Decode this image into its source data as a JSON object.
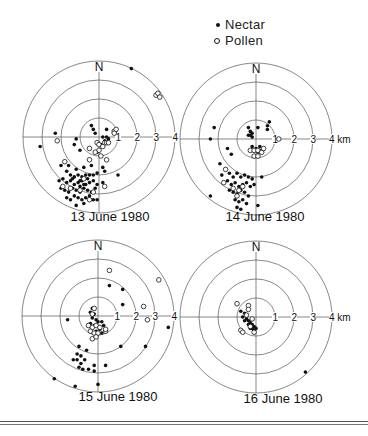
{
  "legend": {
    "nectar_label": "Nectar",
    "pollen_label": "Pollen",
    "nectar_marker": "filled-dot",
    "pollen_marker": "open-circle"
  },
  "colors": {
    "ink": "#111111",
    "grid": "#555555",
    "background": "#ffffff"
  },
  "chart_data": [
    {
      "type": "scatter",
      "title": "13 June 1980",
      "north_label": "N",
      "rings_km": [
        1,
        2,
        3,
        4
      ],
      "tick_labels": [
        "1",
        "2",
        "3",
        "4"
      ],
      "center_px": [
        99,
        137
      ],
      "px_per_km": 19,
      "series": [
        {
          "name": "Nectar",
          "marker": "filled",
          "points_km": [
            [
              1.7,
              3.6
            ],
            [
              -2.3,
              0.2
            ],
            [
              -3.1,
              -0.5
            ],
            [
              -1.2,
              -0.1
            ],
            [
              -1.3,
              -0.4
            ],
            [
              -1.0,
              -0.7
            ],
            [
              -0.4,
              0.6
            ],
            [
              -0.3,
              0.4
            ],
            [
              -0.2,
              0.2
            ],
            [
              0.2,
              0.0
            ],
            [
              0.4,
              0.0
            ],
            [
              0.5,
              -0.1
            ],
            [
              0.3,
              -0.2
            ],
            [
              0.1,
              -0.4
            ],
            [
              -0.1,
              -0.8
            ],
            [
              0.4,
              0.4
            ],
            [
              1.0,
              -2.0
            ],
            [
              0.2,
              -1.6
            ],
            [
              0.3,
              -1.8
            ],
            [
              0.2,
              -2.4
            ],
            [
              0.3,
              -2.6
            ],
            [
              -2.0,
              -1.5
            ],
            [
              -1.7,
              -1.8
            ],
            [
              -1.5,
              -2.0
            ],
            [
              -1.3,
              -2.1
            ],
            [
              -1.1,
              -2.0
            ],
            [
              -0.9,
              -2.1
            ],
            [
              -0.7,
              -2.0
            ],
            [
              -0.5,
              -2.0
            ],
            [
              -0.3,
              -2.0
            ],
            [
              -0.1,
              -1.9
            ],
            [
              -2.1,
              -2.3
            ],
            [
              -1.9,
              -2.2
            ],
            [
              -1.7,
              -2.4
            ],
            [
              -1.5,
              -2.3
            ],
            [
              -1.3,
              -2.5
            ],
            [
              -1.1,
              -2.4
            ],
            [
              -0.9,
              -2.3
            ],
            [
              -0.7,
              -2.5
            ],
            [
              -0.5,
              -2.4
            ],
            [
              -0.3,
              -2.3
            ],
            [
              -0.1,
              -2.5
            ],
            [
              -2.0,
              -2.7
            ],
            [
              -1.8,
              -2.8
            ],
            [
              -1.6,
              -2.9
            ],
            [
              -1.4,
              -2.7
            ],
            [
              -1.2,
              -2.8
            ],
            [
              -1.0,
              -2.9
            ],
            [
              -0.8,
              -2.7
            ],
            [
              -0.6,
              -2.8
            ],
            [
              -0.4,
              -2.9
            ],
            [
              -0.2,
              -2.7
            ],
            [
              -1.7,
              -3.2
            ],
            [
              -1.5,
              -3.3
            ],
            [
              -1.3,
              -3.1
            ],
            [
              -1.1,
              -3.2
            ],
            [
              -0.9,
              -3.3
            ],
            [
              -0.7,
              -3.2
            ],
            [
              -0.5,
              -3.1
            ],
            [
              -0.3,
              -3.3
            ],
            [
              -1.2,
              -3.6
            ],
            [
              -0.8,
              -3.5
            ],
            [
              -0.1,
              -3.3
            ],
            [
              -1.6,
              -1.5
            ],
            [
              -1.2,
              -1.7
            ],
            [
              -0.8,
              -1.6
            ],
            [
              -0.4,
              -1.5
            ],
            [
              -1.4,
              -2.2
            ],
            [
              -1.0,
              -2.3
            ],
            [
              -0.6,
              -2.2
            ],
            [
              -1.0,
              -2.6
            ],
            [
              -0.8,
              -2.5
            ]
          ]
        },
        {
          "name": "Pollen",
          "marker": "open",
          "points_km": [
            [
              3.0,
              2.2
            ],
            [
              3.1,
              2.3
            ],
            [
              3.2,
              2.1
            ],
            [
              0.8,
              0.3
            ],
            [
              0.9,
              0.4
            ],
            [
              0.8,
              0.2
            ],
            [
              -2.2,
              -0.2
            ],
            [
              -0.5,
              -0.6
            ],
            [
              -0.1,
              -0.3
            ],
            [
              0.0,
              -0.4
            ],
            [
              0.2,
              -0.5
            ],
            [
              0.3,
              -0.3
            ],
            [
              0.4,
              -0.3
            ],
            [
              0.5,
              -0.3
            ],
            [
              0.0,
              -0.7
            ],
            [
              -0.2,
              -0.8
            ],
            [
              0.1,
              -1.0
            ],
            [
              -0.5,
              -1.2
            ],
            [
              0.4,
              -1.2
            ],
            [
              -1.8,
              -1.3
            ],
            [
              -1.9,
              -2.6
            ],
            [
              -1.5,
              -2.7
            ],
            [
              -1.0,
              -2.8
            ],
            [
              -0.8,
              -2.2
            ],
            [
              -0.3,
              -2.9
            ],
            [
              0.3,
              -2.6
            ],
            [
              -0.5,
              -3.3
            ]
          ]
        }
      ]
    },
    {
      "type": "scatter",
      "title": "14 June 1980",
      "north_label": "N",
      "rings_km": [
        1,
        2,
        3,
        4
      ],
      "tick_labels": [
        "1",
        "2",
        "3",
        "4 km"
      ],
      "center_px": [
        256,
        139
      ],
      "px_per_km": 19,
      "series": [
        {
          "name": "Nectar",
          "marker": "filled",
          "points_km": [
            [
              -2.2,
              0.6
            ],
            [
              -2.4,
              0.0
            ],
            [
              -0.4,
              0.6
            ],
            [
              -0.3,
              0.4
            ],
            [
              -0.3,
              0.2
            ],
            [
              -0.2,
              0.3
            ],
            [
              -0.4,
              0.2
            ],
            [
              -0.2,
              0.1
            ],
            [
              0.1,
              0.6
            ],
            [
              0.6,
              0.7
            ],
            [
              0.7,
              0.9
            ],
            [
              0.6,
              0.5
            ],
            [
              -0.2,
              -0.4
            ],
            [
              0.0,
              -0.5
            ],
            [
              0.2,
              -0.4
            ],
            [
              0.3,
              -0.6
            ],
            [
              0.1,
              -0.7
            ],
            [
              -1.5,
              -0.5
            ],
            [
              -1.3,
              -0.8
            ],
            [
              -1.9,
              -1.3
            ],
            [
              -1.6,
              -1.6
            ],
            [
              -1.8,
              -1.9
            ],
            [
              -1.4,
              -1.8
            ],
            [
              -1.2,
              -2.0
            ],
            [
              -1.0,
              -1.8
            ],
            [
              -0.8,
              -2.0
            ],
            [
              -0.6,
              -1.9
            ],
            [
              -0.4,
              -2.0
            ],
            [
              -0.2,
              -2.1
            ],
            [
              0.3,
              -2.0
            ],
            [
              -1.7,
              -2.3
            ],
            [
              -1.5,
              -2.2
            ],
            [
              -1.3,
              -2.4
            ],
            [
              -1.1,
              -2.3
            ],
            [
              -0.9,
              -2.5
            ],
            [
              -0.7,
              -2.4
            ],
            [
              -0.5,
              -2.3
            ],
            [
              -0.3,
              -2.5
            ],
            [
              -0.1,
              -2.4
            ],
            [
              -1.4,
              -2.7
            ],
            [
              -1.2,
              -2.8
            ],
            [
              -1.0,
              -2.9
            ],
            [
              -0.8,
              -2.7
            ],
            [
              -0.6,
              -2.8
            ],
            [
              -0.4,
              -3.0
            ],
            [
              -1.1,
              -3.2
            ],
            [
              -0.9,
              -3.3
            ],
            [
              -0.7,
              -3.2
            ],
            [
              -0.5,
              -3.4
            ],
            [
              -1.0,
              -3.6
            ],
            [
              -0.8,
              -3.7
            ],
            [
              -2.4,
              -3.0
            ],
            [
              0.1,
              -3.5
            ]
          ]
        },
        {
          "name": "Pollen",
          "marker": "open",
          "points_km": [
            [
              1.2,
              0.0
            ],
            [
              -0.3,
              -0.6
            ],
            [
              -0.1,
              -0.6
            ],
            [
              0.1,
              -0.6
            ],
            [
              0.3,
              -0.7
            ],
            [
              0.4,
              -0.5
            ],
            [
              -0.1,
              -0.9
            ],
            [
              0.1,
              -0.9
            ],
            [
              -1.6,
              -1.6
            ],
            [
              -1.7,
              -2.3
            ],
            [
              -1.2,
              -2.6
            ],
            [
              -0.9,
              -2.7
            ],
            [
              -1.0,
              -3.0
            ],
            [
              -0.7,
              -2.5
            ]
          ]
        }
      ]
    },
    {
      "type": "scatter",
      "title": "15 June 1980",
      "north_label": "N",
      "rings_km": [
        1,
        2,
        3,
        4
      ],
      "tick_labels": [
        "1",
        "2",
        "3",
        "4"
      ],
      "center_px": [
        98,
        316
      ],
      "px_per_km": 19,
      "series": [
        {
          "name": "Nectar",
          "marker": "filled",
          "points_km": [
            [
              0.6,
              1.6
            ],
            [
              1.3,
              1.4
            ],
            [
              1.3,
              0.6
            ],
            [
              -1.6,
              -0.2
            ],
            [
              3.7,
              -0.6
            ],
            [
              1.2,
              -1.6
            ],
            [
              2.5,
              -1.6
            ],
            [
              0.4,
              -2.6
            ],
            [
              -1.0,
              -1.6
            ],
            [
              -0.6,
              -1.8
            ],
            [
              -0.3,
              0.4
            ],
            [
              -0.4,
              0.2
            ],
            [
              -0.2,
              0.1
            ],
            [
              -0.3,
              -0.1
            ],
            [
              -0.1,
              -0.2
            ],
            [
              -0.4,
              -0.4
            ],
            [
              -0.2,
              -0.5
            ],
            [
              0.0,
              -0.3
            ],
            [
              0.2,
              -0.3
            ],
            [
              0.3,
              -0.5
            ],
            [
              0.1,
              -0.7
            ],
            [
              -0.1,
              -0.8
            ],
            [
              0.2,
              -0.9
            ],
            [
              -1.3,
              -2.3
            ],
            [
              -1.1,
              -2.3
            ],
            [
              -0.9,
              -2.5
            ],
            [
              -0.7,
              -2.3
            ],
            [
              -1.0,
              -2.7
            ],
            [
              -0.8,
              -2.8
            ],
            [
              -0.5,
              -2.8
            ],
            [
              -0.2,
              -2.6
            ],
            [
              -0.2,
              -2.9
            ],
            [
              -1.1,
              -2.0
            ],
            [
              -0.9,
              -2.1
            ],
            [
              -2.3,
              -3.3
            ],
            [
              -1.2,
              -3.7
            ],
            [
              0.0,
              -3.6
            ]
          ]
        },
        {
          "name": "Pollen",
          "marker": "open",
          "points_km": [
            [
              0.6,
              2.4
            ],
            [
              3.2,
              1.9
            ],
            [
              2.4,
              0.5
            ],
            [
              2.6,
              -0.2
            ],
            [
              -0.2,
              0.4
            ],
            [
              -0.3,
              0.1
            ],
            [
              -0.5,
              -0.5
            ],
            [
              -0.3,
              -0.6
            ],
            [
              -0.1,
              -0.5
            ],
            [
              0.1,
              -0.6
            ],
            [
              -0.4,
              -0.8
            ],
            [
              -0.2,
              -0.9
            ],
            [
              0.0,
              -0.9
            ],
            [
              0.4,
              -0.8
            ],
            [
              0.4,
              -0.7
            ],
            [
              -0.3,
              -1.2
            ],
            [
              -0.1,
              -1.1
            ]
          ]
        }
      ]
    },
    {
      "type": "scatter",
      "title": "16 June 1980",
      "north_label": "N",
      "rings_km": [
        1,
        2,
        3,
        4
      ],
      "tick_labels": [
        "1",
        "2",
        "3",
        "4 km"
      ],
      "center_px": [
        256,
        317
      ],
      "px_per_km": 19,
      "series": [
        {
          "name": "Nectar",
          "marker": "filled",
          "points_km": [
            [
              -0.8,
              0.3
            ],
            [
              -0.6,
              0.2
            ],
            [
              -0.7,
              0.0
            ],
            [
              -0.5,
              -0.1
            ],
            [
              -0.6,
              -0.2
            ],
            [
              -0.4,
              -0.2
            ],
            [
              -0.3,
              -0.3
            ],
            [
              -0.4,
              -0.4
            ],
            [
              -0.2,
              -0.4
            ],
            [
              -0.1,
              -0.5
            ],
            [
              -0.2,
              -0.6
            ],
            [
              0.0,
              -0.6
            ],
            [
              -0.1,
              -0.7
            ],
            [
              -0.3,
              -0.6
            ],
            [
              2.6,
              -2.9
            ]
          ]
        },
        {
          "name": "Pollen",
          "marker": "open",
          "points_km": [
            [
              -1.0,
              0.7
            ],
            [
              -0.4,
              0.6
            ],
            [
              -0.4,
              0.4
            ],
            [
              -0.5,
              0.1
            ],
            [
              -0.2,
              -0.1
            ],
            [
              -0.3,
              -0.5
            ],
            [
              -0.8,
              -0.7
            ],
            [
              -0.7,
              -0.8
            ],
            [
              -0.1,
              -0.8
            ]
          ]
        }
      ]
    }
  ]
}
